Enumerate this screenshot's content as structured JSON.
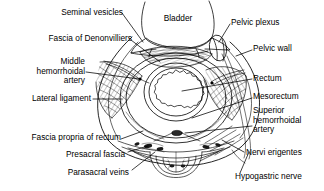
{
  "figure": {
    "type": "anatomical-line-diagram",
    "width": 324,
    "height": 191,
    "background_color": "#ffffff",
    "ink_color": "#000000"
  },
  "labels": {
    "seminal_vesicles": "Seminal vesicles",
    "bladder": "Bladder",
    "pelvic_plexus": "Pelvic plexus",
    "fascia_of_denonvilliers": "Fascia of Denonvilliers",
    "pelvic_wall": "Pelvic wall",
    "middle_hemorrhoidal_artery_l1": "Middle",
    "middle_hemorrhoidal_artery_l2": "hemorrhoidal",
    "middle_hemorrhoidal_artery_l3": "artery",
    "rectum": "Rectum",
    "lateral_ligament": "Lateral ligament",
    "mesorectum": "Mesorectum",
    "superior_hemorrhoidal_artery_l1": "Superior",
    "superior_hemorrhoidal_artery_l2": "hemorrhoidal",
    "superior_hemorrhoidal_artery_l3": "artery",
    "fascia_propria_of_rectum": "Fascia propria of rectum",
    "nervi_erigentes": "Nervi erigentes",
    "presacral_fascia": "Presacral fascia",
    "hypogastric_nerve": "Hypogastric nerve",
    "parasacral_veins": "Parasacral veins"
  },
  "structures": [
    {
      "name": "bladder",
      "label": "Bladder",
      "side": "top-center"
    },
    {
      "name": "seminal-vesicles",
      "label": "Seminal vesicles",
      "side": "top-left"
    },
    {
      "name": "fascia-of-denonvilliers",
      "label": "Fascia of Denonvilliers",
      "side": "left"
    },
    {
      "name": "middle-hemorrhoidal-artery",
      "label": "Middle hemorrhoidal artery",
      "side": "left"
    },
    {
      "name": "lateral-ligament",
      "label": "Lateral ligament",
      "side": "left"
    },
    {
      "name": "fascia-propria-of-rectum",
      "label": "Fascia propria of rectum",
      "side": "bottom-left"
    },
    {
      "name": "presacral-fascia",
      "label": "Presacral fascia",
      "side": "bottom-left"
    },
    {
      "name": "parasacral-veins",
      "label": "Parasacral veins",
      "side": "bottom-left"
    },
    {
      "name": "pelvic-plexus",
      "label": "Pelvic plexus",
      "side": "top-right"
    },
    {
      "name": "pelvic-wall",
      "label": "Pelvic wall",
      "side": "right"
    },
    {
      "name": "rectum",
      "label": "Rectum",
      "side": "right"
    },
    {
      "name": "mesorectum",
      "label": "Mesorectum",
      "side": "right"
    },
    {
      "name": "superior-hemorrhoidal-artery",
      "label": "Superior hemorrhoidal artery",
      "side": "right"
    },
    {
      "name": "nervi-erigentes",
      "label": "Nervi erigentes",
      "side": "bottom-right"
    },
    {
      "name": "hypogastric-nerve",
      "label": "Hypogastric nerve",
      "side": "bottom-right"
    }
  ]
}
